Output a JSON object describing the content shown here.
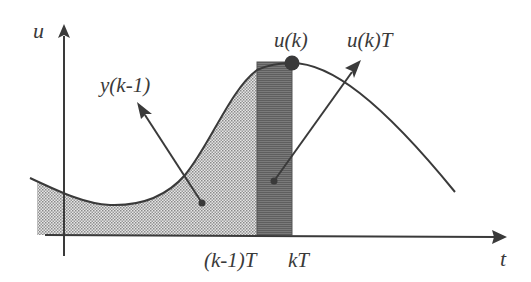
{
  "diagram": {
    "axes": {
      "y_label": "u",
      "x_label": "t"
    },
    "labels": {
      "previous_integral": "y(k-1)",
      "sample_value": "u(k)",
      "rect_area": "u(k)T",
      "tick_prev": "(k-1)T",
      "tick_curr": "kT"
    },
    "colors": {
      "ink": "#3a3a3a",
      "dotted_fill": "#bdbdbd",
      "rect_fill": "#6e6e6e",
      "background": "#ffffff"
    }
  }
}
